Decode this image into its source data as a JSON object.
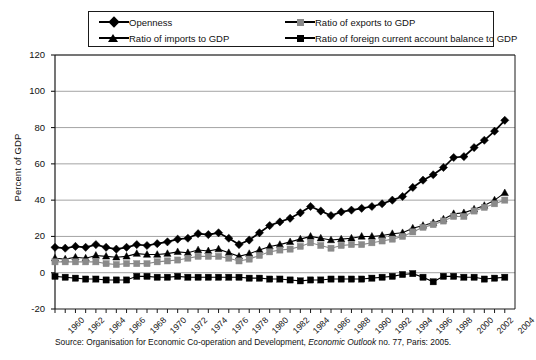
{
  "figure": {
    "ylabel": "Percent of GDP",
    "source_prefix": "Source: Organisation for Economic Co-operation and Development, ",
    "source_italic": "Economic Outlook",
    "source_suffix": " no. 77, Paris: 2005."
  },
  "legend": {
    "items": [
      {
        "label": "Openness",
        "marker": "diamond",
        "color": "#000000"
      },
      {
        "label": "Ratio of  exports to GDP",
        "marker": "square-gray",
        "color": "#8a8a8a"
      },
      {
        "label": "Ratio of imports to GDP",
        "marker": "triangle",
        "color": "#000000"
      },
      {
        "label": "Ratio of foreign current account balance to GDP",
        "marker": "square-dark",
        "color": "#000000"
      }
    ]
  },
  "chart_data": {
    "type": "line",
    "title": "",
    "xlabel": "",
    "ylabel": "Percent of GDP",
    "ylim": [
      -20,
      120
    ],
    "yticks": [
      -20,
      0,
      20,
      40,
      60,
      80,
      100,
      120
    ],
    "xlim": [
      1960,
      2005
    ],
    "grid": true,
    "legend_position": "top",
    "x": [
      1960,
      1961,
      1962,
      1963,
      1964,
      1965,
      1966,
      1967,
      1968,
      1969,
      1970,
      1971,
      1972,
      1973,
      1974,
      1975,
      1976,
      1977,
      1978,
      1979,
      1980,
      1981,
      1982,
      1983,
      1984,
      1985,
      1986,
      1987,
      1988,
      1989,
      1990,
      1991,
      1992,
      1993,
      1994,
      1995,
      1996,
      1997,
      1998,
      1999,
      2000,
      2001,
      2002,
      2003,
      2004
    ],
    "xtick_labels": [
      "1960",
      "1962",
      "1964",
      "1966",
      "1968",
      "1970",
      "1972",
      "1974",
      "1976",
      "1978",
      "1980",
      "1982",
      "1984",
      "1986",
      "1988",
      "1990",
      "1992",
      "1994",
      "1996",
      "1998",
      "2000",
      "2002",
      "2004"
    ],
    "series": [
      {
        "name": "Openness",
        "marker": "diamond",
        "color": "#000000",
        "values": [
          14.0,
          13.5,
          14.5,
          14.0,
          15.5,
          14.0,
          13.0,
          14.0,
          15.5,
          15.0,
          16.0,
          17.0,
          18.5,
          19.0,
          21.5,
          21.0,
          22.0,
          19.0,
          15.5,
          18.0,
          22.0,
          26.0,
          28.0,
          30.0,
          33.0,
          36.5,
          34.0,
          31.5,
          33.5,
          34.5,
          35.5,
          36.5,
          38.0,
          40.0,
          42.0,
          47.0,
          51.0,
          54.0,
          58.0,
          63.5,
          64.0,
          69.0,
          73.0,
          78.0,
          84.0
        ]
      },
      {
        "name": "Ratio of imports to GDP",
        "marker": "triangle",
        "color": "#000000",
        "values": [
          8.0,
          7.5,
          8.5,
          8.0,
          9.5,
          9.0,
          8.5,
          9.0,
          10.5,
          10.0,
          10.0,
          10.5,
          11.5,
          11.0,
          12.5,
          12.0,
          13.0,
          11.0,
          9.0,
          10.5,
          12.5,
          14.5,
          15.5,
          17.0,
          18.5,
          20.0,
          19.0,
          18.0,
          18.5,
          19.0,
          20.0,
          20.0,
          20.5,
          21.5,
          22.0,
          24.5,
          26.0,
          27.5,
          29.5,
          32.5,
          33.0,
          35.0,
          37.0,
          40.0,
          44.0
        ]
      },
      {
        "name": "Ratio of  exports to GDP",
        "marker": "square-gray",
        "color": "#8a8a8a",
        "values": [
          6.0,
          6.0,
          6.0,
          6.0,
          6.0,
          5.0,
          4.5,
          5.0,
          5.0,
          5.0,
          6.0,
          6.5,
          7.0,
          8.0,
          9.0,
          9.0,
          9.0,
          8.0,
          6.5,
          7.5,
          9.5,
          11.5,
          12.5,
          13.0,
          14.5,
          16.5,
          15.0,
          13.5,
          15.0,
          15.5,
          15.5,
          16.5,
          17.5,
          18.5,
          20.0,
          22.5,
          25.0,
          26.5,
          28.5,
          31.0,
          31.0,
          34.0,
          36.0,
          38.0,
          40.0
        ]
      },
      {
        "name": "Ratio of foreign current account balance to GDP",
        "marker": "square-dark",
        "color": "#000000",
        "values": [
          -2.0,
          -2.5,
          -3.0,
          -3.5,
          -3.5,
          -4.0,
          -4.0,
          -4.0,
          -2.0,
          -2.0,
          -2.5,
          -2.5,
          -2.0,
          -2.5,
          -2.5,
          -2.5,
          -2.5,
          -2.5,
          -2.5,
          -3.0,
          -3.0,
          -3.5,
          -3.5,
          -4.0,
          -4.5,
          -4.0,
          -4.0,
          -3.5,
          -3.5,
          -3.5,
          -3.5,
          -3.0,
          -2.5,
          -2.0,
          -1.0,
          -0.5,
          -2.5,
          -5.0,
          -2.0,
          -2.0,
          -2.5,
          -2.5,
          -3.5,
          -3.0,
          -2.5
        ]
      }
    ],
    "annotation": "Openness rises from about 14% of GDP in 1960 to about 102% in 2004; imports end near 54% and exports near 49%; the foreign current account balance stays between about -6% and +6%."
  }
}
